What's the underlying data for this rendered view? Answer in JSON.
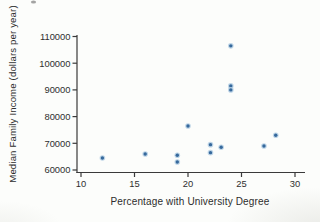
{
  "figure": {
    "background": "#fcfdfb",
    "axis_color": "#3a3a3a",
    "text_color": "#2d2d2d",
    "point_color": "#36699c",
    "point_halo": "#aecbe2"
  },
  "chart_data": {
    "type": "scatter",
    "title": "",
    "xlabel": "Percentage with University Degree",
    "ylabel": "Median Family Income (dollars per year)",
    "xlim": [
      10,
      30
    ],
    "ylim": [
      60000,
      110000
    ],
    "x_ticks": [
      10,
      15,
      20,
      25,
      30
    ],
    "y_ticks": [
      60000,
      70000,
      80000,
      90000,
      100000,
      110000
    ],
    "grid": false,
    "legend": null,
    "points": [
      {
        "x": 12.0,
        "y": 64500
      },
      {
        "x": 16.0,
        "y": 66000
      },
      {
        "x": 19.0,
        "y": 65500
      },
      {
        "x": 19.0,
        "y": 63000
      },
      {
        "x": 20.0,
        "y": 76500
      },
      {
        "x": 22.1,
        "y": 69500
      },
      {
        "x": 22.1,
        "y": 66500
      },
      {
        "x": 23.1,
        "y": 68500
      },
      {
        "x": 24.0,
        "y": 106500
      },
      {
        "x": 24.0,
        "y": 91500
      },
      {
        "x": 24.0,
        "y": 90000
      },
      {
        "x": 27.1,
        "y": 69000
      },
      {
        "x": 28.2,
        "y": 73000
      }
    ]
  }
}
